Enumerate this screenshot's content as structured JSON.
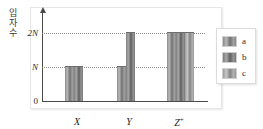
{
  "chart_data": {
    "type": "bar",
    "title": "",
    "xlabel": "",
    "ylabel": "입자 수",
    "ylabel_chars": [
      "입",
      "자",
      "수"
    ],
    "categories": [
      "X",
      "Y",
      "Z⁺"
    ],
    "category_labels": [
      {
        "base": "X",
        "sup": ""
      },
      {
        "base": "Y",
        "sup": ""
      },
      {
        "base": "Z",
        "sup": "+"
      }
    ],
    "series": [
      {
        "name": "a",
        "values": [
          1,
          1,
          2
        ]
      },
      {
        "name": "b",
        "values": [
          1,
          2,
          2
        ]
      },
      {
        "name": "c",
        "values": [
          0,
          0,
          2
        ]
      }
    ],
    "ylim": [
      0,
      2.6
    ],
    "yticks": [
      {
        "value": 0,
        "label": "0"
      },
      {
        "value": 1,
        "label": "N"
      },
      {
        "value": 2,
        "label": "2N"
      }
    ],
    "gridlines": [
      {
        "value": 1,
        "style": "dotted"
      },
      {
        "value": 2,
        "style": "dotted"
      }
    ],
    "grid": true,
    "legend": {
      "position": "right",
      "entries": [
        {
          "label": "a",
          "color": "#8a8a8a"
        },
        {
          "label": "b",
          "color": "#6f6f6f"
        },
        {
          "label": "c",
          "color": "#a0a0a0"
        }
      ]
    },
    "colors": {
      "axis": "#4a4a4a",
      "grid": "#8d8d8d",
      "frame": "#e6e6e6",
      "text": "#2a2a2a",
      "bar_a": "#8a8a8a",
      "bar_b": "#6f6f6f",
      "bar_c": "#a0a0a0"
    }
  }
}
